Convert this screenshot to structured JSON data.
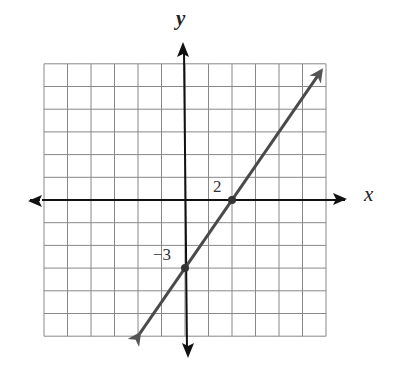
{
  "chart_data": {
    "type": "line",
    "title": "",
    "xlabel": "x",
    "ylabel": "y",
    "xlim": [
      -6,
      6
    ],
    "ylim": [
      -6,
      6
    ],
    "grid": true,
    "grid_step": 1,
    "series": [
      {
        "name": "line",
        "equation": "y = 1.5x - 3",
        "slope": 1.5,
        "intercept": -3,
        "points": [
          {
            "x": 2,
            "y": 0,
            "label": "2"
          },
          {
            "x": 0,
            "y": -3,
            "label": "−3"
          }
        ],
        "extends_both_directions": true,
        "color": "#4a4a4a"
      }
    ],
    "annotations": [
      {
        "text": "2",
        "at": "x-intercept (2, 0)"
      },
      {
        "text": "−3",
        "at": "y-intercept (0, −3)"
      }
    ]
  },
  "labels": {
    "x_axis": "x",
    "y_axis": "y",
    "x_intercept": "2",
    "y_intercept": "−3"
  }
}
